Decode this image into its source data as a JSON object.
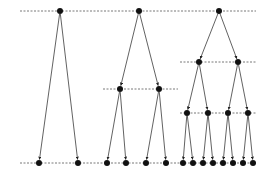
{
  "diagram": {
    "type": "tree-levels",
    "colors": {
      "edge": "#3a3a3a",
      "node": "#111111",
      "level_line": "#555555",
      "background": "#ffffff"
    },
    "level_lines": [
      {
        "id": "top",
        "x1": 20,
        "x2": 256,
        "y": 11
      },
      {
        "id": "t2-mid",
        "x1": 103,
        "x2": 178,
        "y": 89
      },
      {
        "id": "t3-mid",
        "x1": 180,
        "x2": 256,
        "y": 62
      },
      {
        "id": "t3-low",
        "x1": 180,
        "x2": 256,
        "y": 113
      },
      {
        "id": "bottom",
        "x1": 20,
        "x2": 256,
        "y": 163
      }
    ],
    "nodes": [
      {
        "id": "r1",
        "x": 60,
        "y": 11
      },
      {
        "id": "r2",
        "x": 139,
        "y": 11
      },
      {
        "id": "r3",
        "x": 219,
        "y": 11
      },
      {
        "id": "a1",
        "x": 120,
        "y": 89
      },
      {
        "id": "a2",
        "x": 159,
        "y": 89
      },
      {
        "id": "b1",
        "x": 199,
        "y": 62
      },
      {
        "id": "b2",
        "x": 238,
        "y": 62
      },
      {
        "id": "c1",
        "x": 187,
        "y": 113
      },
      {
        "id": "c2",
        "x": 208,
        "y": 113
      },
      {
        "id": "c3",
        "x": 228,
        "y": 113
      },
      {
        "id": "c4",
        "x": 248,
        "y": 113
      },
      {
        "id": "l1",
        "x": 39,
        "y": 163
      },
      {
        "id": "l2",
        "x": 78,
        "y": 163
      },
      {
        "id": "l3",
        "x": 107,
        "y": 163
      },
      {
        "id": "l4",
        "x": 126,
        "y": 163
      },
      {
        "id": "l5",
        "x": 146,
        "y": 163
      },
      {
        "id": "l6",
        "x": 166,
        "y": 163
      },
      {
        "id": "l7",
        "x": 183,
        "y": 163
      },
      {
        "id": "l8",
        "x": 193,
        "y": 163
      },
      {
        "id": "l9",
        "x": 203,
        "y": 163
      },
      {
        "id": "l10",
        "x": 213,
        "y": 163
      },
      {
        "id": "l11",
        "x": 223,
        "y": 163
      },
      {
        "id": "l12",
        "x": 233,
        "y": 163
      },
      {
        "id": "l13",
        "x": 243,
        "y": 163
      },
      {
        "id": "l14",
        "x": 253,
        "y": 163
      }
    ],
    "edges": [
      [
        "r1",
        "l1"
      ],
      [
        "r1",
        "l2"
      ],
      [
        "r2",
        "a1"
      ],
      [
        "r2",
        "a2"
      ],
      [
        "a1",
        "l3"
      ],
      [
        "a1",
        "l4"
      ],
      [
        "a2",
        "l5"
      ],
      [
        "a2",
        "l6"
      ],
      [
        "r3",
        "b1"
      ],
      [
        "r3",
        "b2"
      ],
      [
        "b1",
        "c1"
      ],
      [
        "b1",
        "c2"
      ],
      [
        "b2",
        "c3"
      ],
      [
        "b2",
        "c4"
      ],
      [
        "c1",
        "l7"
      ],
      [
        "c1",
        "l8"
      ],
      [
        "c2",
        "l9"
      ],
      [
        "c2",
        "l10"
      ],
      [
        "c3",
        "l11"
      ],
      [
        "c3",
        "l12"
      ],
      [
        "c4",
        "l13"
      ],
      [
        "c4",
        "l14"
      ]
    ]
  }
}
